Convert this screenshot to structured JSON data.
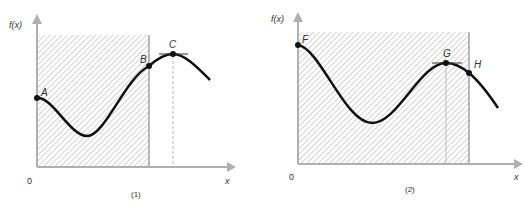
{
  "figure": {
    "colors": {
      "axis": "#b0b0b0",
      "curve": "#111111",
      "hatch": "#a8a8a8",
      "boundary": "#777777",
      "text": "#333333"
    },
    "panels": [
      {
        "caption": "(1)",
        "y_axis_label": "f(x)",
        "x_axis_label": "x",
        "origin_label": "0",
        "points": [
          {
            "label": "A",
            "description": "curve start at left boundary"
          },
          {
            "label": "B",
            "description": "curve at right edge of shaded region"
          },
          {
            "label": "C",
            "description": "local maximum with horizontal tangent, outside shaded region"
          }
        ]
      },
      {
        "caption": "(2)",
        "y_axis_label": "f(x)",
        "x_axis_label": "x",
        "origin_label": "0",
        "points": [
          {
            "label": "F",
            "description": "curve start at left boundary (maximum)"
          },
          {
            "label": "G",
            "description": "local maximum with horizontal tangent, inside shaded region"
          },
          {
            "label": "H",
            "description": "curve at right edge of shaded region"
          }
        ]
      }
    ]
  }
}
